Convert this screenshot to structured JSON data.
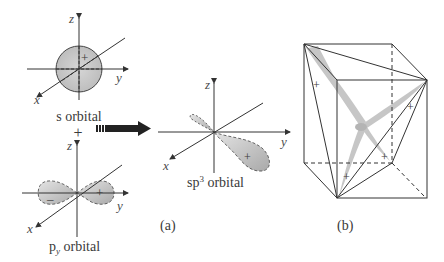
{
  "figure": {
    "panel_a": {
      "label": "(a)",
      "s_orbital": {
        "caption": "s orbital",
        "sign": "+",
        "axes": {
          "x": "x",
          "y": "y",
          "z": "z"
        }
      },
      "plus_operator": "+",
      "arrow": "combine-arrow",
      "p_orbital": {
        "caption_main": "p",
        "caption_sub": "y",
        "caption_rest": " orbital",
        "signs": {
          "left": "–",
          "right": "+"
        },
        "axes": {
          "x": "x",
          "y": "y",
          "z": "z"
        }
      },
      "sp3_orbital": {
        "caption_main": "sp",
        "caption_sup": "3",
        "caption_rest": " orbital",
        "sign": "+",
        "axes": {
          "x": "x",
          "y": "y",
          "z": "z"
        }
      }
    },
    "panel_b": {
      "label": "(b)",
      "signs": [
        "+",
        "+",
        "+",
        "+"
      ],
      "description": "four sp3 lobes pointing to tetrahedron vertices inscribed in a cube"
    },
    "colors": {
      "lobe_fill": "#c8c8c8",
      "line": "#333333",
      "lobe_b": "#bdbdbd"
    }
  }
}
